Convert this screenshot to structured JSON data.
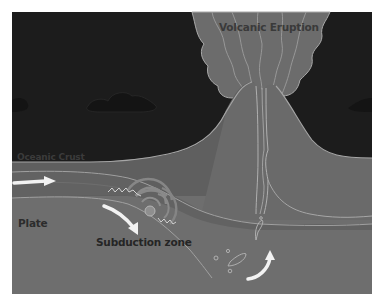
{
  "diagram": {
    "labels": {
      "eruption": "Volcanic Eruption",
      "oceanic_crust": "Oceanic Crust",
      "plate": "Plate",
      "subduction_zone": "Subduction zone"
    },
    "colors": {
      "sky": "#1c1c1c",
      "cloud": "#141414",
      "plume": "#6c6c6c",
      "cone": "#6a6a6a",
      "crust": "#5e5e5e",
      "slab": "#626262",
      "mantle": "#6e6e6e",
      "outline": "#a6a6a6",
      "arrow": "#f2f2f2",
      "quake_ring": "#8a8a8a"
    },
    "elements": [
      "sky-background",
      "clouds",
      "eruption-plume",
      "volcano-cone",
      "magma-conduit",
      "oceanic-crust",
      "subducting-plate",
      "plate-motion-arrow",
      "subduction-arrow",
      "earthquake-focus",
      "magma-blobs",
      "rising-magma-arrow"
    ]
  }
}
